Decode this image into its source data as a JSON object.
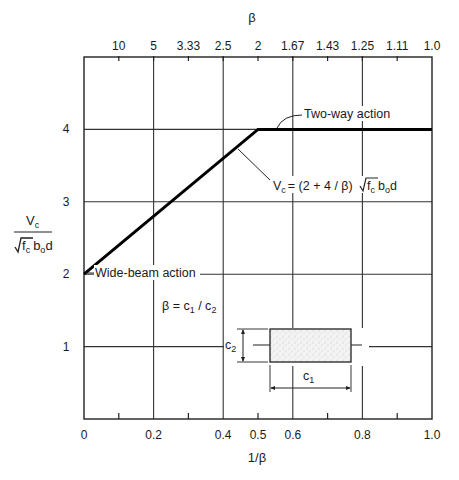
{
  "chart_data": {
    "type": "line",
    "title": "",
    "xlabel": "1/β",
    "ylabel": "Vc / (√f'c bo d)",
    "top_xlabel": "β",
    "xlim": [
      0,
      1.0
    ],
    "ylim": [
      0,
      5
    ],
    "grid": true,
    "x_ticks_major": [
      0,
      0.2,
      0.4,
      0.6,
      0.8,
      1.0
    ],
    "x_tick_labels": [
      "0",
      "0.2",
      "0.4",
      "0.5",
      "0.6",
      "0.8",
      "1.0"
    ],
    "x_tick_label_positions": [
      0,
      0.2,
      0.4,
      0.5,
      0.6,
      0.8,
      1.0
    ],
    "x_ticks_minor": [
      0.1,
      0.3,
      0.5,
      0.7,
      0.9
    ],
    "top_tick_positions": [
      0.1,
      0.2,
      0.3,
      0.4,
      0.5,
      0.6,
      0.7,
      0.8,
      0.9,
      1.0
    ],
    "top_tick_labels": [
      "10",
      "5",
      "3.33",
      "2.5",
      "2",
      "1.67",
      "1.43",
      "1.25",
      "1.11",
      "1.0"
    ],
    "y_ticks": [
      1,
      2,
      3,
      4
    ],
    "y_tick_labels": [
      "1",
      "2",
      "3",
      "4"
    ],
    "series": [
      {
        "name": "Vc/(√f'c bo d)",
        "x": [
          0,
          0.5,
          1.0
        ],
        "y": [
          2,
          4,
          4
        ]
      }
    ],
    "annotations": [
      {
        "text": "Two-way action",
        "x": 0.6,
        "y": 4.15
      },
      {
        "text": "Vc = (2 + 4/β) √f'c bo d",
        "x": 0.55,
        "y": 3.2
      },
      {
        "text": "Wide-beam action",
        "x": 0.02,
        "y": 2
      },
      {
        "text": "β = c1 / c2",
        "x": 0.2,
        "y": 1.6
      }
    ]
  },
  "labels": {
    "top_axis_title": "β",
    "bottom_axis_title": "1/β",
    "y_axis_numerator": "V",
    "y_axis_numerator_sub": "c",
    "y_axis_den_f": "f",
    "y_axis_den_f_sub": "c",
    "y_axis_den_b": "b",
    "y_axis_den_b_sub": "o",
    "y_axis_den_d": "d",
    "two_way": "Two-way action",
    "wide_beam": "Wide-beam action",
    "eq_v": "V",
    "eq_v_sub": "c",
    "eq_mid": "= (2 + 4 / β)",
    "eq_f": "f",
    "eq_f_sub": "c",
    "eq_b": "b",
    "eq_b_sub": "o",
    "eq_d": "d",
    "beta_def_lhs": "β = c",
    "beta_def_sub1": "1",
    "beta_def_mid": " / c",
    "beta_def_sub2": "2",
    "c1": "c",
    "c1_sub": "1",
    "c2": "c",
    "c2_sub": "2"
  }
}
